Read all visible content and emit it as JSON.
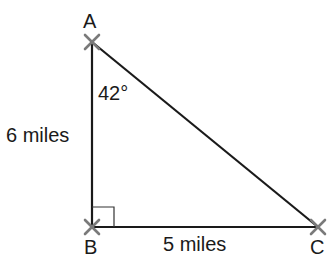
{
  "diagram": {
    "type": "right-triangle",
    "vertices": [
      {
        "label": "A",
        "x": 92,
        "y": 42
      },
      {
        "label": "B",
        "x": 92,
        "y": 227
      },
      {
        "label": "C",
        "x": 318,
        "y": 227
      }
    ],
    "angle_label": "42°",
    "side_ab_label": "6 miles",
    "side_bc_label": "5 miles",
    "right_angle_at": "B",
    "colors": {
      "line": "#1a1a1a",
      "marker": "#7a7a7a"
    }
  }
}
